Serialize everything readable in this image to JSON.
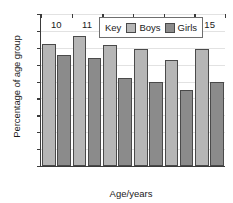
{
  "chart_data": {
    "type": "bar",
    "title": "",
    "xlabel": "Age/years",
    "ylabel": "Percentage of age group",
    "categories": [
      "10",
      "11",
      "12",
      "13",
      "14",
      "15"
    ],
    "series": [
      {
        "name": "Boys",
        "color": "#b6b6b6",
        "values": [
          72.5,
          77,
          71.5,
          69,
          62.5,
          69
        ]
      },
      {
        "name": "Girls",
        "color": "#8b8b8b",
        "values": [
          66,
          64,
          52,
          50,
          45,
          50
        ]
      }
    ],
    "ylim": [
      0,
      90
    ],
    "ytick_step": 10,
    "yticks": [
      "90",
      "80",
      "70",
      "60",
      "50",
      "40",
      "30",
      "20",
      "10",
      "0"
    ],
    "grid": true,
    "grid_axis": "y",
    "legend_position": "top-center"
  },
  "legend": {
    "key_label": "Key",
    "entries": [
      {
        "label": "Boys",
        "color": "#b6b6b6"
      },
      {
        "label": "Girls",
        "color": "#8b8b8b"
      }
    ]
  }
}
